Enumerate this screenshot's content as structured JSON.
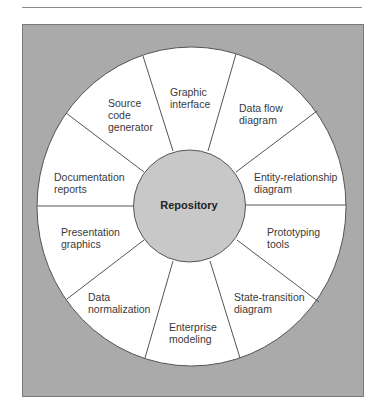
{
  "diagram": {
    "center": {
      "label": "Repository",
      "fill": "#c8c8c8"
    },
    "background_color": "#aaaaaa",
    "segments": [
      {
        "id": "graphic-interface",
        "lines": [
          "Graphic",
          "interface"
        ]
      },
      {
        "id": "data-flow-diagram",
        "lines": [
          "Data flow",
          "diagram"
        ]
      },
      {
        "id": "entity-relationship-diagram",
        "lines": [
          "Entity-relationship",
          "diagram"
        ]
      },
      {
        "id": "prototyping-tools",
        "lines": [
          "Prototyping",
          "tools"
        ]
      },
      {
        "id": "state-transition-diagram",
        "lines": [
          "State-transition",
          "diagram"
        ]
      },
      {
        "id": "enterprise-modeling",
        "lines": [
          "Enterprise",
          "modeling"
        ]
      },
      {
        "id": "data-normalization",
        "lines": [
          "Data",
          "normalization"
        ]
      },
      {
        "id": "presentation-graphics",
        "lines": [
          "Presentation",
          "graphics"
        ]
      },
      {
        "id": "documentation-reports",
        "lines": [
          "Documentation",
          "reports"
        ]
      },
      {
        "id": "source-code-generator",
        "lines": [
          "Source",
          "code",
          "generator"
        ]
      }
    ]
  }
}
